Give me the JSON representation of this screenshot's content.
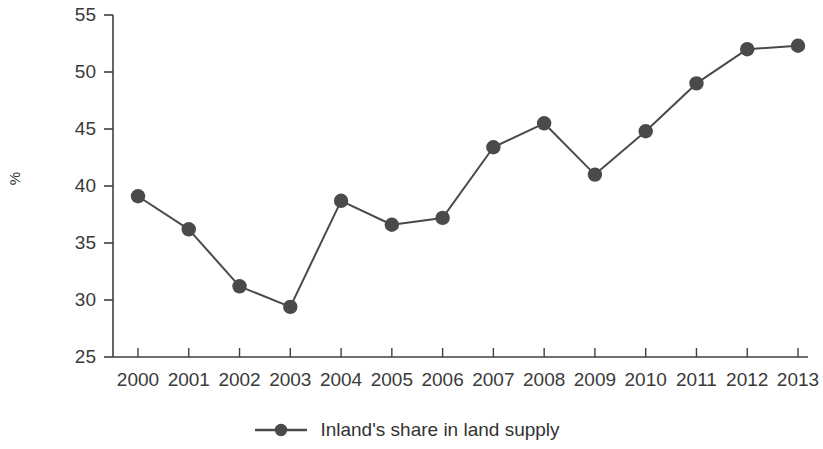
{
  "chart_data": {
    "type": "line",
    "title": "",
    "subtitle": "",
    "xlabel": "",
    "ylabel": "%",
    "categories": [
      "2000",
      "2001",
      "2002",
      "2003",
      "2004",
      "2005",
      "2006",
      "2007",
      "2008",
      "2009",
      "2010",
      "2011",
      "2012",
      "2013"
    ],
    "values": [
      39.1,
      36.2,
      31.2,
      29.4,
      38.7,
      36.6,
      37.2,
      43.4,
      45.5,
      41.0,
      44.8,
      49.0,
      52.0,
      52.3
    ],
    "series": [
      {
        "name": "Inland's share in land supply",
        "values": [
          39.1,
          36.2,
          31.2,
          29.4,
          38.7,
          36.6,
          37.2,
          43.4,
          45.5,
          41.0,
          44.8,
          49.0,
          52.0,
          52.3
        ]
      }
    ],
    "ylim": [
      25,
      55
    ],
    "yticks": [
      25,
      30,
      35,
      40,
      45,
      50,
      55
    ],
    "ytick_labels": [
      "25",
      "30",
      "35",
      "40",
      "45",
      "50",
      "55"
    ],
    "xtick_labels": [
      "2000",
      "2001",
      "2002",
      "2003",
      "2004",
      "2005",
      "2006",
      "2007",
      "2008",
      "2009",
      "2010",
      "2011",
      "2012",
      "2013"
    ],
    "grid": false,
    "legend_position": "bottom-center",
    "marker": "circle",
    "line_color": "#4a4a4a",
    "marker_color": "#4a4a4a",
    "axis_color": "#3f3f3f"
  },
  "legend": {
    "entries": [
      {
        "label": "Inland's share in land supply",
        "marker": "line-circle-marker",
        "color": "#4a4a4a"
      }
    ]
  },
  "axes": {
    "y_title": "%",
    "y_tick_labels": [
      "55",
      "50",
      "45",
      "40",
      "35",
      "30",
      "25"
    ],
    "x_tick_labels": [
      "2000",
      "2001",
      "2002",
      "2003",
      "2004",
      "2005",
      "2006",
      "2007",
      "2008",
      "2009",
      "2010",
      "2011",
      "2012",
      "2013"
    ]
  }
}
